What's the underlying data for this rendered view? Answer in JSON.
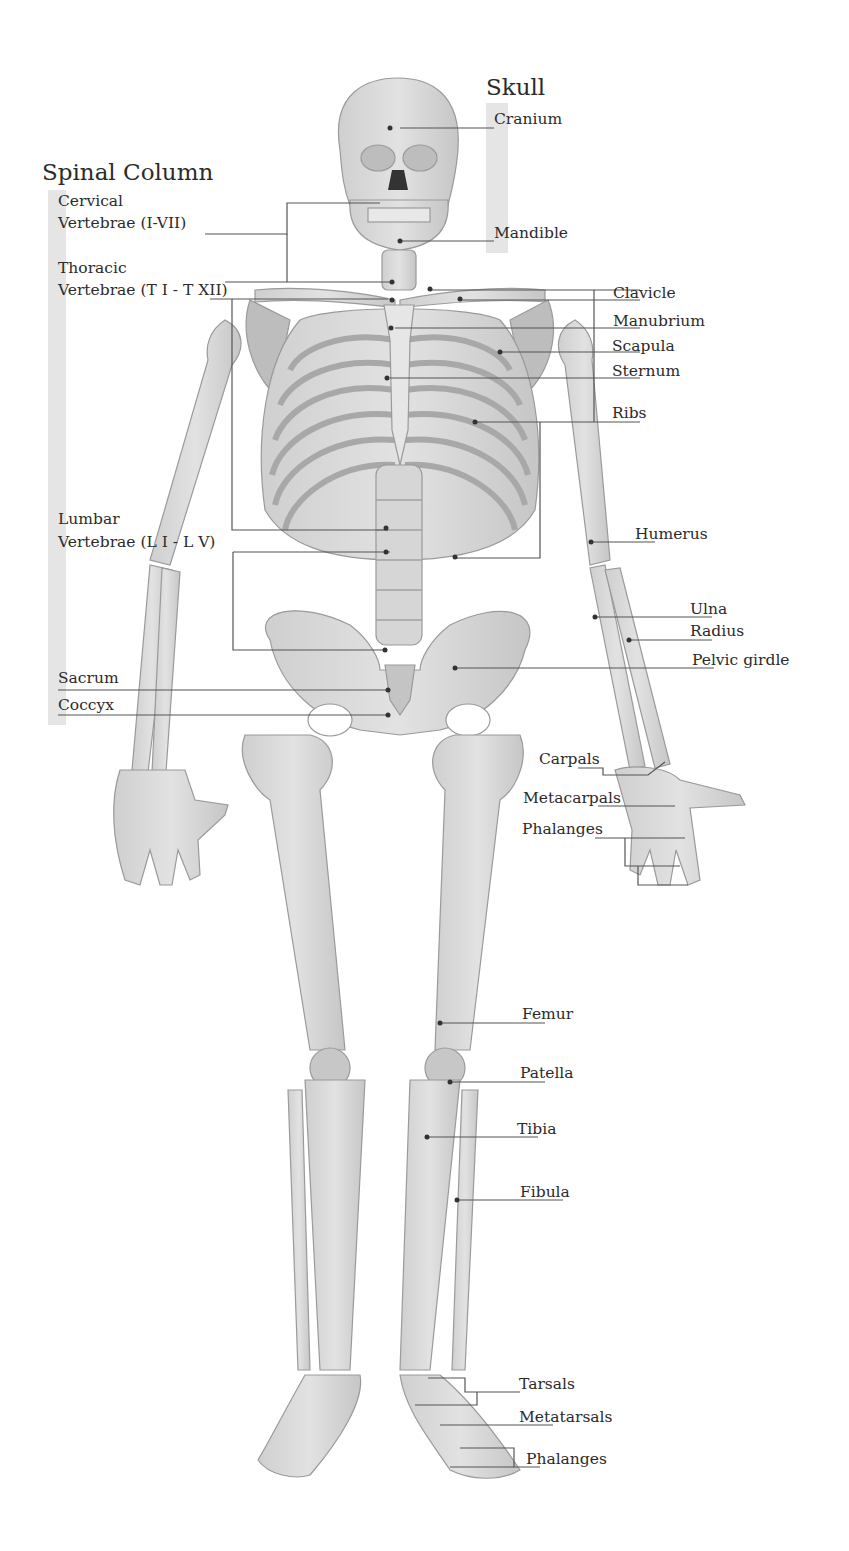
{
  "diagram": {
    "type": "anatomical-labeled-illustration",
    "colors": {
      "bone": "#dcdcdc",
      "bone_shadow": "#b9b9b9",
      "bone_outline": "#9a9a9a",
      "leader_line": "#555555",
      "group_band": "#e0e0e0",
      "text": "#2b2b2b"
    }
  },
  "groups": {
    "skull": {
      "title": "Skull",
      "labels": [
        "Cranium",
        "Mandible"
      ]
    },
    "spinal_column": {
      "title": "Spinal Column",
      "labels": [
        {
          "line1": "Cervical",
          "line2": "Vertebrae (I-VII)"
        },
        {
          "line1": "Thoracic",
          "line2": "Vertebrae (T I - T XII)"
        },
        {
          "line1": "Lumbar",
          "line2": "Vertebrae (L I - L V)"
        },
        {
          "line1": "Sacrum"
        },
        {
          "line1": "Coccyx"
        }
      ]
    }
  },
  "right_labels": [
    "Clavicle",
    "Manubrium",
    "Scapula",
    "Sternum",
    "Ribs",
    "Humerus",
    "Ulna",
    "Radius",
    "Pelvic girdle",
    "Carpals",
    "Metacarpals",
    "Phalanges",
    "Femur",
    "Patella",
    "Tibia",
    "Fibula",
    "Tarsals",
    "Metatarsals",
    "Phalanges"
  ]
}
